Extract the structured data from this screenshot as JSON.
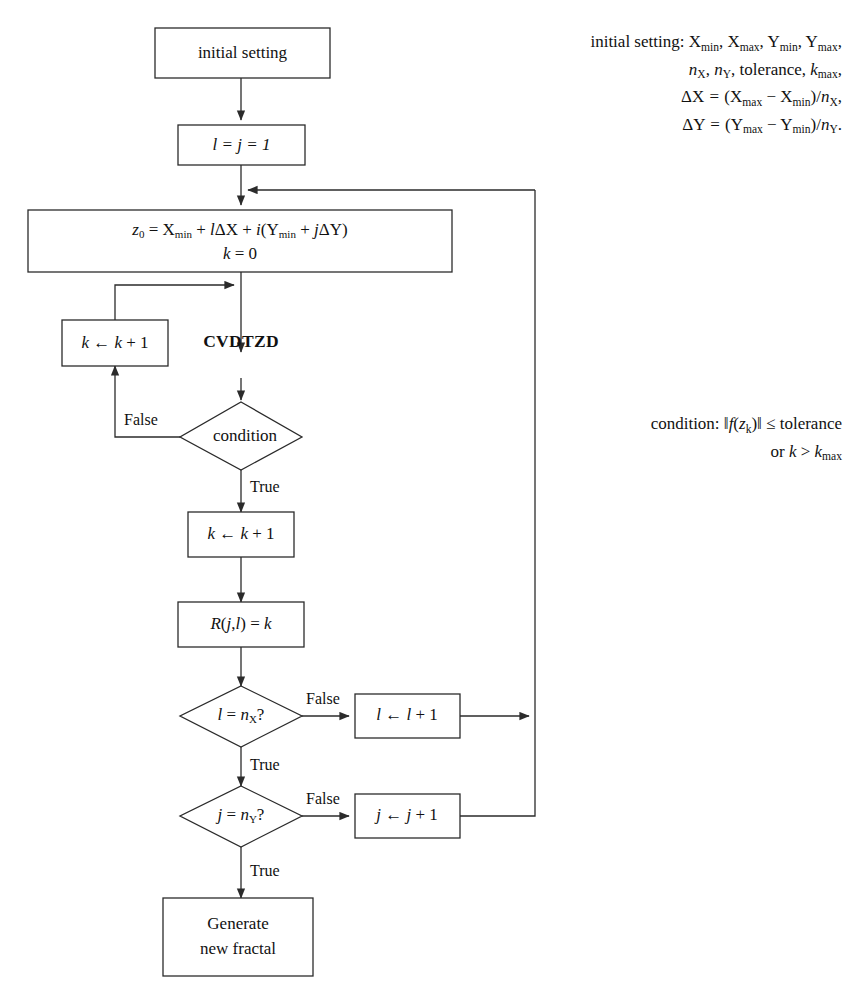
{
  "diagram": {
    "type": "flowchart",
    "background_color": "#ffffff",
    "line_color": "#2b2b2b",
    "text_color": "#111111"
  },
  "nodes": {
    "initial_setting": {
      "label": "initial setting",
      "shape": "rect"
    },
    "init_indices": {
      "label": "l = j = 1",
      "shape": "rect"
    },
    "z0_line1": {
      "label": "z0 = Xmin + lΔX + i(Ymin + jΔY)"
    },
    "z0_line2": {
      "label": "k = 0"
    },
    "increment_k_loop": {
      "label": "k ← k + 1",
      "shape": "rect"
    },
    "cvdtzd": {
      "label": "CVDTZD",
      "shape": "text"
    },
    "condition": {
      "label": "condition",
      "shape": "diamond"
    },
    "increment_k_after": {
      "label": "k ← k + 1",
      "shape": "rect"
    },
    "store_result": {
      "label": "R(j,l) = k",
      "shape": "rect"
    },
    "check_l": {
      "label": "l = nX?",
      "shape": "diamond"
    },
    "increment_l": {
      "label": "l ← l + 1",
      "shape": "rect"
    },
    "check_j": {
      "label": "j = nY?",
      "shape": "diamond"
    },
    "increment_j": {
      "label": "j ← j + 1",
      "shape": "rect"
    },
    "generate_line1": {
      "label": "Generate"
    },
    "generate_line2": {
      "label": "new fractal"
    }
  },
  "edge_labels": {
    "condition_false": "False",
    "condition_true": "True",
    "check_l_false": "False",
    "check_l_true": "True",
    "check_j_false": "False",
    "check_j_true": "True"
  },
  "notes": {
    "initial_setting": {
      "lines": [
        "initial setting: Xmin, Xmax, Ymin, Ymax,",
        "nX, nY, tolerance, kmax,",
        "ΔX = (Xmax − Xmin)/nX,",
        "ΔY = (Ymax − Ymin)/nY."
      ]
    },
    "condition": {
      "lines": [
        "condition: ‖f(zk)‖ ≤ tolerance",
        "or k > kmax"
      ]
    }
  }
}
